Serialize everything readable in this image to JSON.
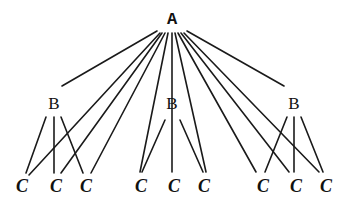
{
  "diagram": {
    "type": "tree",
    "nodes": {
      "root": {
        "label": "A",
        "x": 172,
        "y": 19
      },
      "level1": [
        {
          "label": "B",
          "x": 54,
          "y": 103
        },
        {
          "label": "B",
          "x": 172,
          "y": 103
        },
        {
          "label": "B",
          "x": 294,
          "y": 103
        }
      ],
      "level2": [
        {
          "label": "C",
          "x": 22,
          "y": 186
        },
        {
          "label": "C",
          "x": 56,
          "y": 186
        },
        {
          "label": "C",
          "x": 86,
          "y": 186
        },
        {
          "label": "C",
          "x": 141,
          "y": 186
        },
        {
          "label": "C",
          "x": 174,
          "y": 186
        },
        {
          "label": "C",
          "x": 204,
          "y": 186
        },
        {
          "label": "C",
          "x": 263,
          "y": 186
        },
        {
          "label": "C",
          "x": 296,
          "y": 186
        },
        {
          "label": "C",
          "x": 326,
          "y": 186
        }
      ]
    },
    "edges_root_to_b": [
      {
        "x1": 157,
        "y1": 31,
        "x2": 62,
        "y2": 86
      },
      {
        "x1": 187,
        "y1": 31,
        "x2": 284,
        "y2": 86
      }
    ],
    "edges_root_to_c": [
      {
        "x1": 160,
        "y1": 33,
        "x2": 29,
        "y2": 175
      },
      {
        "x1": 162,
        "y1": 33,
        "x2": 61,
        "y2": 173
      },
      {
        "x1": 165,
        "y1": 33,
        "x2": 91,
        "y2": 173
      },
      {
        "x1": 168,
        "y1": 33,
        "x2": 140,
        "y2": 172
      },
      {
        "x1": 172,
        "y1": 33,
        "x2": 172,
        "y2": 172
      },
      {
        "x1": 175,
        "y1": 33,
        "x2": 206,
        "y2": 172
      },
      {
        "x1": 178,
        "y1": 33,
        "x2": 256,
        "y2": 172
      },
      {
        "x1": 181,
        "y1": 33,
        "x2": 289,
        "y2": 172
      },
      {
        "x1": 184,
        "y1": 33,
        "x2": 319,
        "y2": 172
      }
    ],
    "edges_b_to_c": [
      {
        "x1": 46,
        "y1": 117,
        "x2": 26,
        "y2": 173
      },
      {
        "x1": 54,
        "y1": 117,
        "x2": 54,
        "y2": 173
      },
      {
        "x1": 61,
        "y1": 117,
        "x2": 83,
        "y2": 173
      },
      {
        "x1": 165,
        "y1": 120,
        "x2": 142,
        "y2": 172
      },
      {
        "x1": 180,
        "y1": 120,
        "x2": 203,
        "y2": 172
      },
      {
        "x1": 287,
        "y1": 117,
        "x2": 265,
        "y2": 172
      },
      {
        "x1": 294,
        "y1": 117,
        "x2": 294,
        "y2": 172
      },
      {
        "x1": 301,
        "y1": 117,
        "x2": 323,
        "y2": 172
      }
    ]
  }
}
